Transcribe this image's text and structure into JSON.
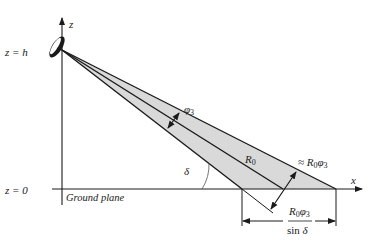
{
  "diagram": {
    "axes": {
      "z_label": "z",
      "x_label": "x",
      "height_label": "z = h",
      "ground_label": "z = 0",
      "ground_plane_label": "Ground plane"
    },
    "labels": {
      "beamwidth": "φ3",
      "range": "R0",
      "approx_width_prefix": "≈ ",
      "approx_width": "R0φ3",
      "elevation_angle": "δ",
      "footprint_numerator": "R0φ3",
      "footprint_denominator": "sin δ"
    },
    "colors": {
      "beam_fill": "#d9d9d9",
      "line": "#1a1a1a",
      "background": "#ffffff"
    }
  }
}
